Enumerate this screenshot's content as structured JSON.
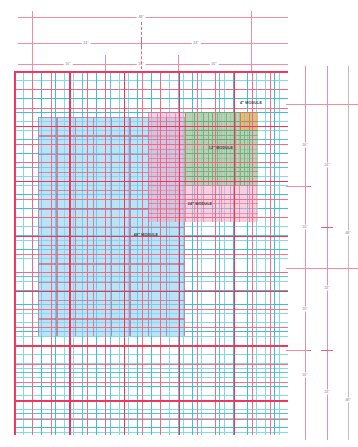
{
  "drawing": {
    "title": "Modular Grid Dimension Study",
    "units": "inches"
  },
  "colors": {
    "base_grid": "#6fd4e8",
    "mid_grid": "#2fb6d6",
    "dim_line": "#ef8fa6",
    "dim_tick": "#e8607f",
    "red_grid": "#f4617f",
    "heavy_red_grid": "#f0325a",
    "module_48": "#8fd3f0",
    "module_24": "#f3a8c4",
    "module_12": "#8fd49a",
    "module_4": "#f0b070",
    "label_text": "#3a3a3a",
    "dim_text": "#8a7a80"
  },
  "top_dimensions": {
    "rows": [
      {
        "row": 1,
        "segments": [
          {
            "label": "48\"",
            "start_px": 32,
            "end_px": 251
          }
        ]
      },
      {
        "row": 2,
        "segments": [
          {
            "label": "24\"",
            "start_px": 32,
            "end_px": 141
          },
          {
            "label": "24\"",
            "start_px": 141,
            "end_px": 251
          }
        ]
      },
      {
        "row": 3,
        "segments": [
          {
            "label": "16\"",
            "start_px": 32,
            "end_px": 105
          },
          {
            "label": "16\"",
            "start_px": 105,
            "end_px": 178
          },
          {
            "label": "16\"",
            "start_px": 178,
            "end_px": 251
          }
        ]
      }
    ]
  },
  "right_dimensions": {
    "columns": [
      {
        "col": 1,
        "segments": [
          {
            "label": "16\"",
            "start_px": 104,
            "end_px": 186
          },
          {
            "label": "16\"",
            "start_px": 186,
            "end_px": 268
          },
          {
            "label": "16\"",
            "start_px": 268,
            "end_px": 350
          },
          {
            "label": "16\"",
            "start_px": 350,
            "end_px": 432
          }
        ]
      },
      {
        "col": 2,
        "segments": [
          {
            "label": "24\"",
            "start_px": 104,
            "end_px": 227
          },
          {
            "label": "24\"",
            "start_px": 227,
            "end_px": 350
          },
          {
            "label": "24\"",
            "start_px": 350,
            "end_px": 432
          }
        ]
      },
      {
        "col": 3,
        "segments": [
          {
            "label": "48\"",
            "start_px": 104,
            "end_px": 268
          },
          {
            "label": "48\"",
            "start_px": 268,
            "end_px": 432
          }
        ]
      }
    ]
  },
  "modules": [
    {
      "id": "module-48",
      "label": "48\" MODULE",
      "color": "#8fd3f0",
      "x": 38,
      "y": 117,
      "w": 147,
      "h": 219,
      "label_x": 146,
      "label_y": 235
    },
    {
      "id": "module-24",
      "label": "24\" MODULE",
      "color": "#f3a8c4",
      "x": 148,
      "y": 112,
      "w": 110,
      "h": 110,
      "label_x": 200,
      "label_y": 204
    },
    {
      "id": "module-12",
      "label": "12\" MODULE",
      "color": "#8fd49a",
      "x": 185,
      "y": 112,
      "w": 73,
      "h": 73,
      "label_x": 221,
      "label_y": 148
    },
    {
      "id": "module-4",
      "label": "4\" MODULE",
      "color": "#f0b070",
      "x": 240,
      "y": 112,
      "w": 18,
      "h": 18,
      "label_x": 251,
      "label_y": 103
    }
  ],
  "grid_field": {
    "x": 14,
    "y": 71,
    "w": 274,
    "h": 364,
    "fine_cell_px": 4.57,
    "fine_cell_label": "4\"",
    "mid_cell_px": 13.7,
    "mid_cell_label": "12\"",
    "red_cell_px": 18.3,
    "red_cell_label": "16\"",
    "heavy_cell_px": 54.9,
    "heavy_cell_label": "48\""
  }
}
